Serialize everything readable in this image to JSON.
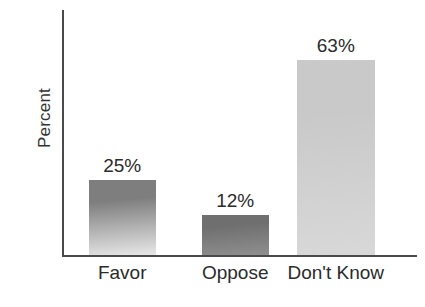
{
  "chart_data": {
    "type": "bar",
    "title": "",
    "subtitle": "",
    "xlabel": "",
    "ylabel": "Percent",
    "categories": [
      "Favor",
      "Oppose",
      "Don't Know"
    ],
    "values": [
      25,
      12,
      63
    ],
    "value_labels": [
      "25%",
      "12%",
      "63%"
    ],
    "ylim": [
      0,
      80
    ],
    "grid": false,
    "legend": null,
    "annotations": [],
    "bar_styles": [
      {
        "name": "favor-bar",
        "top_color": "#7e7e7e",
        "bottom_color": "#e8e8e8"
      },
      {
        "name": "oppose-bar",
        "top_color": "#6f6f6f",
        "bottom_color": "#8f8f8f"
      },
      {
        "name": "dont-know-bar",
        "top_color": "#c9c9c9",
        "bottom_color": "#d8d8d8"
      }
    ],
    "axis_color": "#4a4a4a",
    "text_color": "#2b2b2b",
    "background_color": "#ffffff"
  },
  "geometry": {
    "bars": [
      {
        "left_pct": 7,
        "width_pct": 19,
        "height_pct": 30.6,
        "center_pct": 16.5
      },
      {
        "left_pct": 39,
        "width_pct": 19,
        "height_pct": 16.3,
        "center_pct": 48.5
      },
      {
        "left_pct": 66,
        "width_pct": 22,
        "height_pct": 79.6,
        "center_pct": 77.0
      }
    ]
  }
}
